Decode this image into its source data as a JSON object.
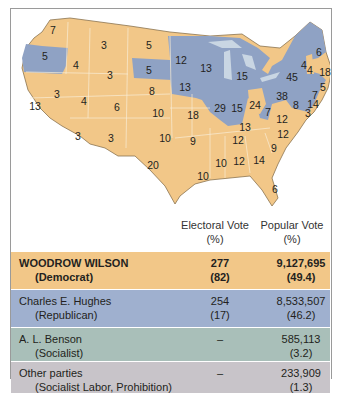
{
  "map": {
    "colors": {
      "democrat": "#f2c788",
      "republican": "#8fa2c4",
      "water": "#c9d6e3",
      "border": "#f8ecd6"
    },
    "state_labels": [
      {
        "state": "WA",
        "ev": "7",
        "party": "D",
        "x": 43,
        "y": 22
      },
      {
        "state": "OR",
        "ev": "5",
        "party": "R",
        "x": 35,
        "y": 48
      },
      {
        "state": "CA",
        "ev": "13",
        "party": "D",
        "x": 25,
        "y": 98
      },
      {
        "state": "ID",
        "ev": "4",
        "party": "D",
        "x": 66,
        "y": 57
      },
      {
        "state": "NV",
        "ev": "3",
        "party": "D",
        "x": 47,
        "y": 86
      },
      {
        "state": "MT",
        "ev": "3",
        "party": "D",
        "x": 94,
        "y": 37
      },
      {
        "state": "WY",
        "ev": "3",
        "party": "D",
        "x": 100,
        "y": 67
      },
      {
        "state": "UT",
        "ev": "4",
        "party": "D",
        "x": 74,
        "y": 93
      },
      {
        "state": "CO",
        "ev": "6",
        "party": "D",
        "x": 107,
        "y": 99
      },
      {
        "state": "AZ",
        "ev": "3",
        "party": "D",
        "x": 68,
        "y": 128
      },
      {
        "state": "NM",
        "ev": "3",
        "party": "D",
        "x": 101,
        "y": 130
      },
      {
        "state": "ND",
        "ev": "5",
        "party": "D",
        "x": 139,
        "y": 37
      },
      {
        "state": "SD",
        "ev": "5",
        "party": "R",
        "x": 139,
        "y": 62
      },
      {
        "state": "NE",
        "ev": "8",
        "party": "D",
        "x": 142,
        "y": 83
      },
      {
        "state": "KS",
        "ev": "10",
        "party": "D",
        "x": 148,
        "y": 105
      },
      {
        "state": "OK",
        "ev": "10",
        "party": "D",
        "x": 155,
        "y": 130
      },
      {
        "state": "TX",
        "ev": "20",
        "party": "D",
        "x": 143,
        "y": 157
      },
      {
        "state": "MN",
        "ev": "12",
        "party": "R",
        "x": 171,
        "y": 52
      },
      {
        "state": "IA",
        "ev": "13",
        "party": "R",
        "x": 175,
        "y": 79
      },
      {
        "state": "MO",
        "ev": "18",
        "party": "D",
        "x": 183,
        "y": 107
      },
      {
        "state": "AR",
        "ev": "9",
        "party": "D",
        "x": 183,
        "y": 133
      },
      {
        "state": "LA",
        "ev": "10",
        "party": "D",
        "x": 193,
        "y": 168
      },
      {
        "state": "WI",
        "ev": "13",
        "party": "R",
        "x": 196,
        "y": 60
      },
      {
        "state": "IL",
        "ev": "29",
        "party": "R",
        "x": 210,
        "y": 100
      },
      {
        "state": "MI",
        "ev": "15",
        "party": "R",
        "x": 232,
        "y": 68
      },
      {
        "state": "IN",
        "ev": "15",
        "party": "R",
        "x": 227,
        "y": 100
      },
      {
        "state": "OH",
        "ev": "24",
        "party": "D",
        "x": 245,
        "y": 97
      },
      {
        "state": "KY",
        "ev": "13",
        "party": "D",
        "x": 235,
        "y": 119
      },
      {
        "state": "TN",
        "ev": "12",
        "party": "D",
        "x": 228,
        "y": 132
      },
      {
        "state": "MS",
        "ev": "10",
        "party": "D",
        "x": 211,
        "y": 155
      },
      {
        "state": "AL",
        "ev": "12",
        "party": "D",
        "x": 229,
        "y": 153
      },
      {
        "state": "GA",
        "ev": "14",
        "party": "D",
        "x": 249,
        "y": 152
      },
      {
        "state": "FL",
        "ev": "6",
        "party": "D",
        "x": 265,
        "y": 181
      },
      {
        "state": "SC",
        "ev": "9",
        "party": "D",
        "x": 264,
        "y": 140
      },
      {
        "state": "NC",
        "ev": "12",
        "party": "D",
        "x": 273,
        "y": 126
      },
      {
        "state": "VA",
        "ev": "12",
        "party": "D",
        "x": 272,
        "y": 111
      },
      {
        "state": "WV",
        "ev": "7",
        "party": "R",
        "x": 258,
        "y": 104
      },
      {
        "state": "PA",
        "ev": "38",
        "party": "R",
        "x": 272,
        "y": 88
      },
      {
        "state": "NY",
        "ev": "45",
        "party": "R",
        "x": 282,
        "y": 69
      },
      {
        "state": "VT",
        "ev": "4",
        "party": "R",
        "x": 294,
        "y": 57
      },
      {
        "state": "NH",
        "ev": "4",
        "party": "D",
        "x": 300,
        "y": 62
      },
      {
        "state": "ME",
        "ev": "6",
        "party": "R",
        "x": 309,
        "y": 44
      },
      {
        "state": "MA",
        "ev": "18",
        "party": "R",
        "x": 315,
        "y": 64
      },
      {
        "state": "RI",
        "ev": "5",
        "party": "R",
        "x": 313,
        "y": 79
      },
      {
        "state": "CT",
        "ev": "7",
        "party": "R",
        "x": 305,
        "y": 87
      },
      {
        "state": "NJ",
        "ev": "14",
        "party": "R",
        "x": 303,
        "y": 96
      },
      {
        "state": "DE",
        "ev": "3",
        "party": "R",
        "x": 298,
        "y": 105
      },
      {
        "state": "MD",
        "ev": "8",
        "party": "D",
        "x": 286,
        "y": 97
      }
    ]
  },
  "table": {
    "headers": {
      "electoral": "Electoral Vote",
      "electoral_sub": "(%)",
      "popular": "Popular Vote",
      "popular_sub": "(%)"
    },
    "rows": [
      {
        "name": "WOODROW WILSON",
        "party": "(Democrat)",
        "ev": "277",
        "ev_pct": "(82)",
        "pv": "9,127,695",
        "pv_pct": "(49.4)",
        "bold": true,
        "color": "#f2c788"
      },
      {
        "name": "Charles E. Hughes",
        "party": "(Republican)",
        "ev": "254",
        "ev_pct": "(17)",
        "pv": "8,533,507",
        "pv_pct": "(46.2)",
        "bold": false,
        "color": "#9fb0cf"
      },
      {
        "name": "A. L. Benson",
        "party": "(Socialist)",
        "ev": "–",
        "ev_pct": "",
        "pv": "585,113",
        "pv_pct": "(3.2)",
        "bold": false,
        "color": "#a9bfb9"
      },
      {
        "name": "Other parties",
        "party": "(Socialist Labor, Prohibition)",
        "ev": "–",
        "ev_pct": "",
        "pv": "233,909",
        "pv_pct": "(1.3)",
        "bold": false,
        "color": "#c8c4c9"
      }
    ]
  }
}
